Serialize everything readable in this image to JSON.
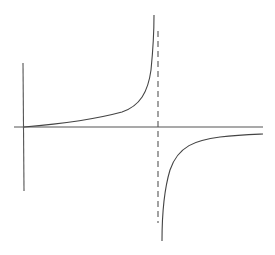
{
  "diagram": {
    "colors": {
      "background": "#ffffff",
      "axis": "#555555",
      "curve": "#444444",
      "asymptote": "#555555"
    },
    "axes": {
      "x_axis": {
        "x1": 14,
        "y1": 127,
        "x2": 263,
        "y2": 127
      },
      "y_axis": {
        "x1": 23,
        "y1": 63,
        "x2": 24,
        "y2": 191
      }
    },
    "asymptote": {
      "x1": 158,
      "y1": 31,
      "x2": 158,
      "y2": 223,
      "dash": "6,4"
    },
    "curves": {
      "left_branch": "M 24 127 C 60 124, 100 118, 122 112 C 140 106, 148 92, 151 70 C 153 50, 154 30, 154 15",
      "right_branch": "M 162 241 C 162 220, 164 190, 170 170 C 178 146, 196 140, 220 137 C 238 135, 252 134.5, 263 134"
    }
  }
}
